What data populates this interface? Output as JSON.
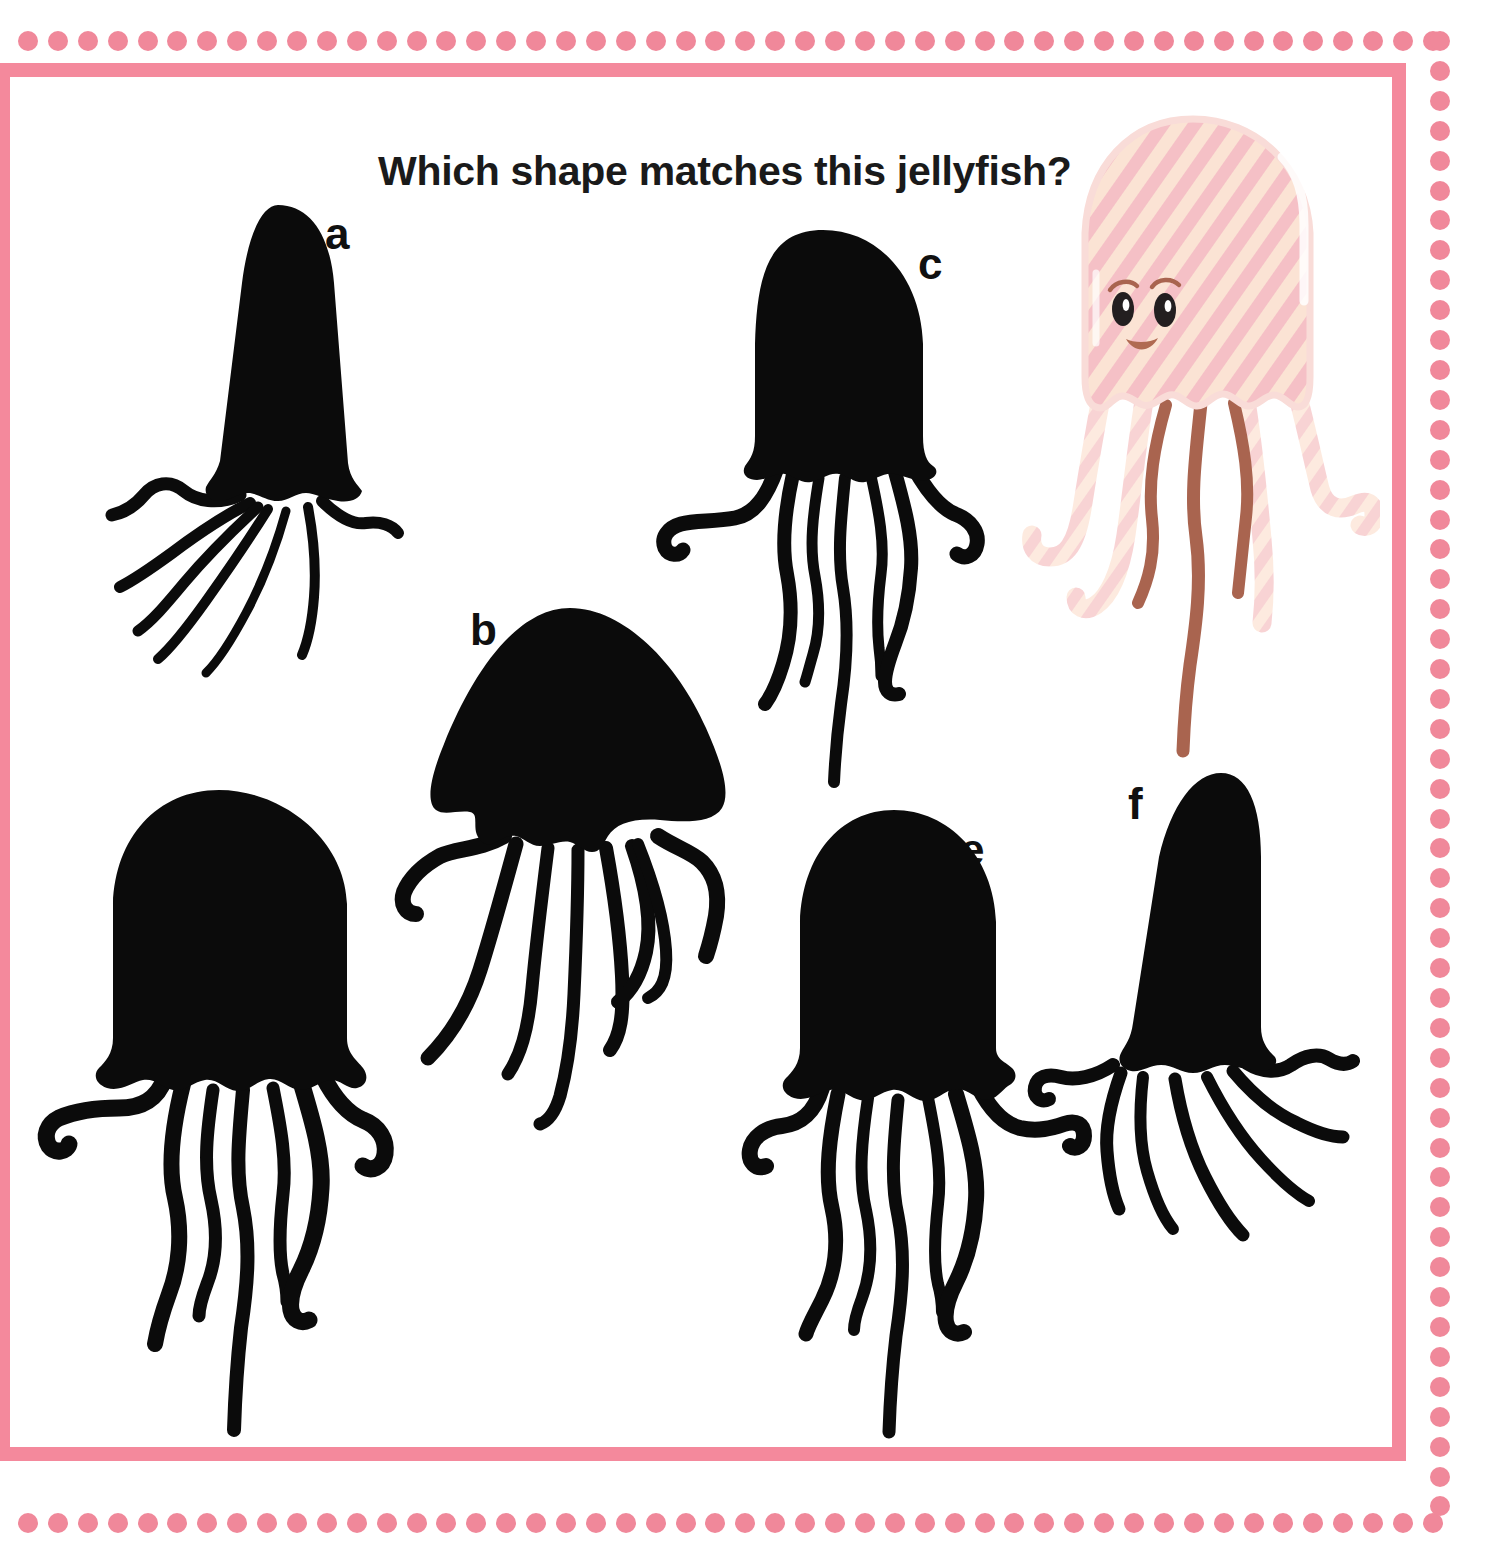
{
  "worksheet": {
    "type": "shape-matching-puzzle",
    "subject": "jellyfish",
    "question": "Which shape matches this jellyfish?",
    "background_color": "#ffffff",
    "border": {
      "style": "dotted-outer-with-solid-inner-frame",
      "dot_color": "#f0889a",
      "frame_color": "#f4899c",
      "dot_count_horizontal": 48,
      "dot_count_vertical": 50
    }
  },
  "reference": {
    "name": "pink-striped-jellyfish",
    "label": "",
    "colors": {
      "bell_stripe_pink": "#f5c0c6",
      "bell_stripe_cream": "#fbe3d4",
      "bell_edge": "#f9d8d8",
      "tentacle_light": "#fbe0d4",
      "tentacle_dark": "#a9644f",
      "eye": "#231f20",
      "eye_highlight": "#ffffff",
      "mouth": "#b06a52",
      "highlight": "#ffffff"
    },
    "features": {
      "bell_shape": "tall rounded dome with flared scalloped base",
      "tentacle_count_light": 4,
      "tentacle_count_dark": 3,
      "has_face": true,
      "eyebrows": 2,
      "smile": true
    }
  },
  "options": [
    {
      "id": "a",
      "label": "a",
      "silhouette": "narrow tall cone bell, tentacles sweeping lower-left",
      "matches_reference": false,
      "color": "#0b0b0b"
    },
    {
      "id": "b",
      "label": "b",
      "silhouette": "wide flat mushroom dome bell, long drooping tentacles",
      "matches_reference": false,
      "color": "#0b0b0b"
    },
    {
      "id": "c",
      "label": "c",
      "silhouette": "rounded dome bell, narrower body, straight tentacles",
      "matches_reference": false,
      "color": "#0b0b0b"
    },
    {
      "id": "d",
      "label": "d",
      "silhouette": "wide rounded dome bell with flared scalloped base",
      "matches_reference": true,
      "color": "#0b0b0b"
    },
    {
      "id": "e",
      "label": "e",
      "silhouette": "rounded dome bell with flared base, slightly narrower",
      "matches_reference": false,
      "color": "#0b0b0b"
    },
    {
      "id": "f",
      "label": "f",
      "silhouette": "tall tapered cone bell, tentacles fanning lower-right",
      "matches_reference": false,
      "color": "#0b0b0b"
    }
  ]
}
